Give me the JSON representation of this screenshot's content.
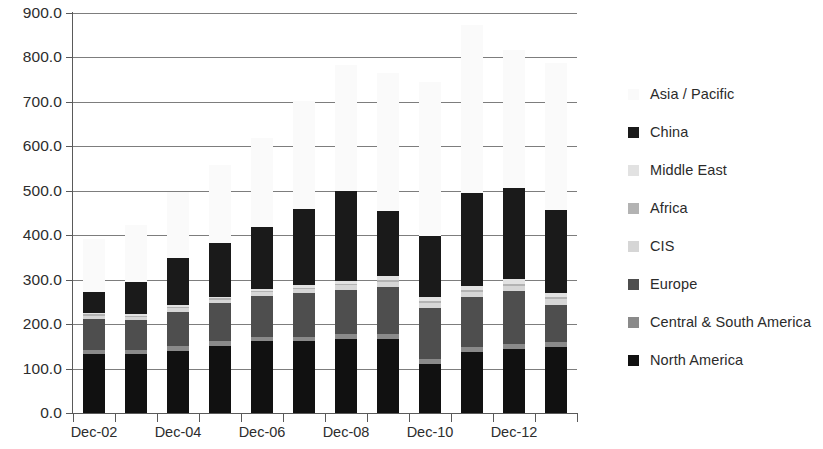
{
  "chart_data": {
    "type": "bar",
    "stacked": true,
    "title": "",
    "subtitle": "",
    "xlabel": "",
    "ylabel": "",
    "ylim": [
      0,
      900
    ],
    "ytick_step": 100,
    "ytick_labels": [
      "900.0",
      "800.0",
      "700.0",
      "600.0",
      "500.0",
      "400.0",
      "300.0",
      "200.0",
      "100.0",
      "0.0"
    ],
    "grid": true,
    "legend_position": "right",
    "categories": [
      "Dec-02",
      "Dec-03",
      "Dec-04",
      "Dec-05",
      "Dec-06",
      "Dec-07",
      "Dec-08",
      "Dec-09",
      "Dec-10",
      "Dec-11",
      "Dec-12",
      "Dec-13"
    ],
    "xtick_labels_shown": [
      "Dec-02",
      "Dec-04",
      "Dec-06",
      "Dec-08",
      "Dec-10",
      "Dec-12"
    ],
    "series": [
      {
        "name": "North America",
        "color": "#111111",
        "values": [
          133,
          132,
          140,
          151,
          162,
          162,
          166,
          166,
          110,
          137,
          145,
          149
        ]
      },
      {
        "name": "Central & South America",
        "color": "#8a8a8a",
        "values": [
          9,
          9,
          10,
          10,
          10,
          10,
          11,
          11,
          11,
          11,
          11,
          11
        ]
      },
      {
        "name": "Europe",
        "color": "#4e4e4e",
        "values": [
          70,
          68,
          78,
          86,
          91,
          98,
          100,
          107,
          115,
          112,
          118,
          84
        ]
      },
      {
        "name": "CIS",
        "color": "#d6d6d6",
        "values": [
          7,
          7,
          8,
          8,
          9,
          9,
          10,
          11,
          11,
          12,
          12,
          12
        ]
      },
      {
        "name": "Africa",
        "color": "#b3b3b3",
        "values": [
          3,
          3,
          3,
          3,
          3,
          3,
          3,
          4,
          4,
          4,
          4,
          4
        ]
      },
      {
        "name": "Middle East",
        "color": "#e2e2e2",
        "values": [
          3,
          3,
          4,
          4,
          5,
          6,
          8,
          9,
          10,
          10,
          11,
          11
        ]
      },
      {
        "name": "China",
        "color": "#1a1a1a",
        "values": [
          47,
          73,
          105,
          120,
          138,
          170,
          201,
          146,
          138,
          208,
          206,
          186
        ]
      },
      {
        "name": "Asia / Pacific",
        "color": "#fafafa",
        "values": [
          120,
          128,
          150,
          175,
          200,
          245,
          285,
          310,
          345,
          380,
          310,
          330
        ]
      }
    ],
    "totals": [
      392,
      423,
      498,
      557,
      618,
      703,
      784,
      764,
      744,
      874,
      817,
      787
    ]
  },
  "legend": {
    "items": [
      {
        "label": "Asia / Pacific",
        "color": "#fafafa"
      },
      {
        "label": "China",
        "color": "#1a1a1a"
      },
      {
        "label": "Middle East",
        "color": "#e2e2e2"
      },
      {
        "label": "Africa",
        "color": "#b3b3b3"
      },
      {
        "label": "CIS",
        "color": "#d6d6d6"
      },
      {
        "label": "Europe",
        "color": "#4e4e4e"
      },
      {
        "label": "Central & South America",
        "color": "#8a8a8a"
      },
      {
        "label": "North America",
        "color": "#111111"
      }
    ]
  }
}
